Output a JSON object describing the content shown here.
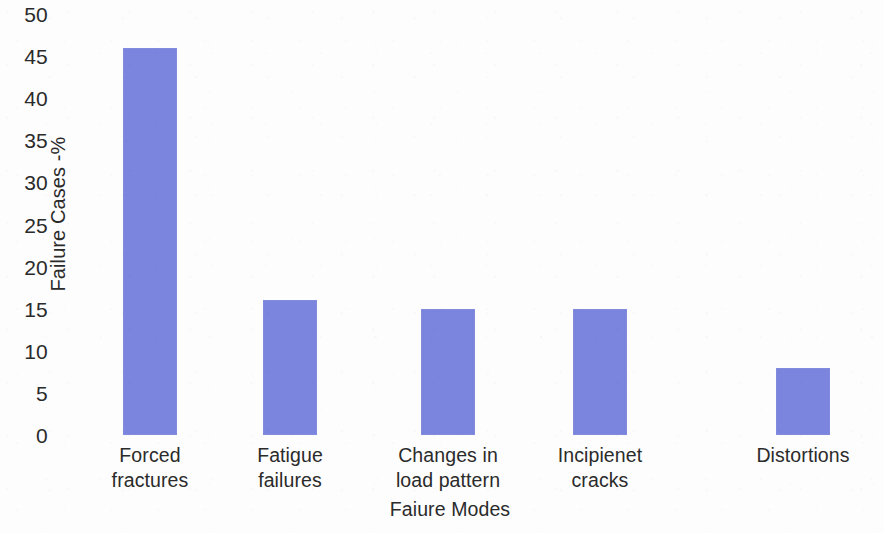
{
  "chart_data": {
    "type": "bar",
    "title": "",
    "subtitle": "",
    "categories": [
      "Forced fractures",
      "Fatigue failures",
      "Changes in load pattern",
      "Incipienet cracks",
      "Distortions"
    ],
    "category_lines": [
      [
        "Forced",
        "fractures"
      ],
      [
        "Fatigue",
        "failures"
      ],
      [
        "Changes in",
        "load pattern"
      ],
      [
        "Incipienet",
        "cracks"
      ],
      [
        "Distortions"
      ]
    ],
    "values": [
      46,
      16,
      15,
      15,
      8
    ],
    "xlabel": "Faiure Modes",
    "ylabel": "Failure Cases -%",
    "ylim": [
      0,
      50
    ],
    "ytick_labels": [
      "50",
      "45",
      "40",
      "35",
      "30",
      "25",
      "20",
      "15",
      "10",
      "5",
      "0"
    ],
    "ytick_values": [
      50,
      45,
      40,
      35,
      30,
      25,
      20,
      15,
      10,
      5,
      0
    ],
    "grid": false,
    "legend": null,
    "bar_color": "#7b85dd",
    "text_color": "#2b2b2b",
    "background_color": "#fdfdfd"
  }
}
